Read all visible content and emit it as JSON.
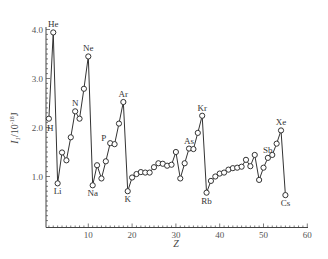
{
  "chart_data": {
    "type": "line",
    "title": "",
    "xlabel": "Z",
    "ylabel": "I_1/10^-18 J",
    "ylabel_display": {
      "main": "I",
      "sub": "1",
      "rest": "/10",
      "sup": "-18",
      "unit": "J"
    },
    "xlim": [
      0,
      60
    ],
    "ylim": [
      0,
      4.0
    ],
    "x_ticks": [
      10,
      20,
      30,
      40,
      50,
      60
    ],
    "y_ticks": [
      1.0,
      2.0,
      3.0,
      4.0
    ],
    "y_tick_labels": [
      "1.0",
      "2.0",
      "3.0",
      "4.0"
    ],
    "grid": false,
    "legend": null,
    "marker": "open-circle",
    "series": [
      {
        "name": "First ionization energy",
        "x": [
          1,
          2,
          3,
          4,
          5,
          6,
          7,
          8,
          9,
          10,
          11,
          12,
          13,
          14,
          15,
          16,
          17,
          18,
          19,
          20,
          21,
          22,
          23,
          24,
          25,
          26,
          27,
          28,
          29,
          30,
          31,
          32,
          33,
          34,
          35,
          36,
          37,
          38,
          39,
          40,
          41,
          42,
          43,
          44,
          45,
          46,
          47,
          48,
          49,
          50,
          51,
          52,
          53,
          54,
          55
        ],
        "values": [
          2.18,
          3.94,
          0.86,
          1.49,
          1.33,
          1.8,
          2.33,
          2.18,
          2.79,
          3.45,
          0.82,
          1.23,
          0.96,
          1.31,
          1.68,
          1.66,
          2.08,
          2.52,
          0.7,
          0.98,
          1.05,
          1.09,
          1.08,
          1.08,
          1.19,
          1.27,
          1.26,
          1.22,
          1.24,
          1.5,
          0.96,
          1.27,
          1.57,
          1.56,
          1.89,
          2.24,
          0.67,
          0.91,
          1.0,
          1.06,
          1.08,
          1.14,
          1.17,
          1.18,
          1.2,
          1.34,
          1.21,
          1.44,
          0.93,
          1.18,
          1.38,
          1.44,
          1.67,
          1.94,
          0.62
        ]
      }
    ],
    "annotations": [
      {
        "text": "H",
        "z": 1,
        "pos": "right"
      },
      {
        "text": "He",
        "z": 2,
        "pos": "above"
      },
      {
        "text": "Li",
        "z": 3,
        "pos": "below"
      },
      {
        "text": "N",
        "z": 7,
        "pos": "above"
      },
      {
        "text": "Ne",
        "z": 10,
        "pos": "above"
      },
      {
        "text": "Na",
        "z": 11,
        "pos": "below"
      },
      {
        "text": "P",
        "z": 15,
        "pos": "left"
      },
      {
        "text": "Ar",
        "z": 18,
        "pos": "above"
      },
      {
        "text": "K",
        "z": 19,
        "pos": "below"
      },
      {
        "text": "As",
        "z": 33,
        "pos": "above"
      },
      {
        "text": "Kr",
        "z": 36,
        "pos": "above"
      },
      {
        "text": "Rb",
        "z": 37,
        "pos": "below"
      },
      {
        "text": "Sb",
        "z": 51,
        "pos": "above"
      },
      {
        "text": "Xe",
        "z": 54,
        "pos": "above"
      },
      {
        "text": "Cs",
        "z": 55,
        "pos": "below"
      }
    ]
  },
  "colors": {
    "line": "#333333",
    "axis": "#444444",
    "text": "#444444",
    "background": "#ffffff"
  }
}
